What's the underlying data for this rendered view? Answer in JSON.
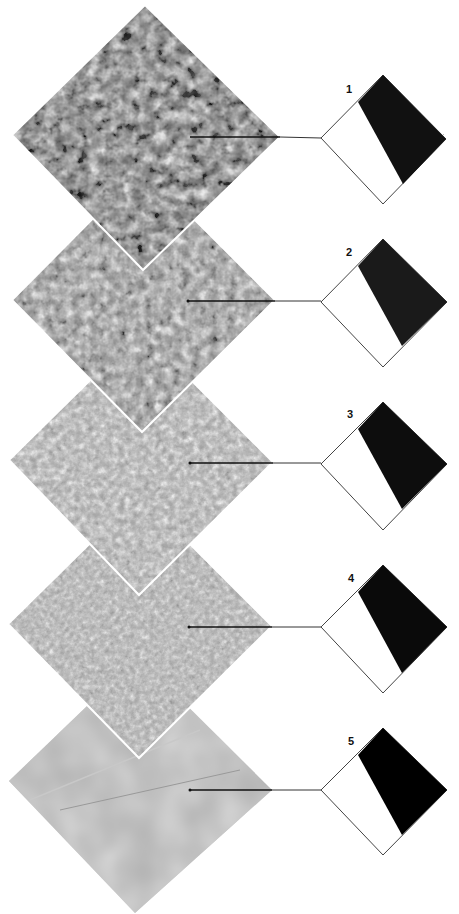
{
  "figure": {
    "stages": [
      {
        "label": "1",
        "texture": "very coarse",
        "tone": "#6a6a6a",
        "contrast": 1.0,
        "dark_fill": "#111111"
      },
      {
        "label": "2",
        "texture": "coarse",
        "tone": "#8a8a8a",
        "contrast": 0.8,
        "dark_fill": "#1a1a1a"
      },
      {
        "label": "3",
        "texture": "medium",
        "tone": "#a4a4a4",
        "contrast": 0.55,
        "dark_fill": "#0d0d0d"
      },
      {
        "label": "4",
        "texture": "fine",
        "tone": "#a8a8a8",
        "contrast": 0.45,
        "dark_fill": "#0a0a0a"
      },
      {
        "label": "5",
        "texture": "smooth",
        "tone": "#b0b0b0",
        "contrast": 0.2,
        "dark_fill": "#000000"
      }
    ]
  }
}
